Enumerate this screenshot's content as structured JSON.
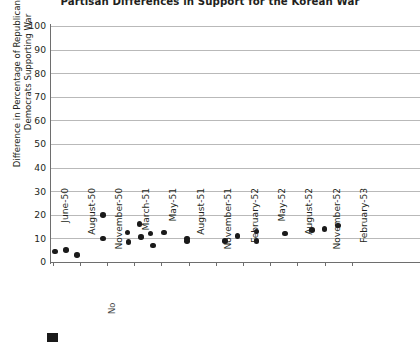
{
  "chart_data": {
    "type": "scatter",
    "title": "Partisan Differences in Support for the Korean War",
    "xlabel": "",
    "ylabel": "Difference in Percentage of Republicans and Democrats Supporting War",
    "ylim": [
      0,
      100
    ],
    "y_ticks": [
      100,
      90,
      80,
      70,
      60,
      50,
      40,
      30,
      20,
      10,
      0
    ],
    "grid": true,
    "legend_position": "bottom-left",
    "categories": [
      "June-50",
      "August-50",
      "November-50",
      "March-51",
      "May-51",
      "August-51",
      "November-51",
      "February-52",
      "May-52",
      "August-52",
      "November-52",
      "February-53"
    ],
    "series": [
      {
        "name": "Difference in percentage of Republicans and Democrats supporting war",
        "marker": "circle",
        "color": "#1a1a1a",
        "points": [
          {
            "x": 0.1,
            "y": 4.5
          },
          {
            "x": 0.5,
            "y": 5.0
          },
          {
            "x": 0.9,
            "y": 3.0
          },
          {
            "x": 1.85,
            "y": 20.0
          },
          {
            "x": 1.85,
            "y": 10.0
          },
          {
            "x": 2.75,
            "y": 12.5
          },
          {
            "x": 2.8,
            "y": 8.5
          },
          {
            "x": 3.2,
            "y": 16.0
          },
          {
            "x": 3.25,
            "y": 10.5
          },
          {
            "x": 3.6,
            "y": 12.0
          },
          {
            "x": 3.7,
            "y": 7.0
          },
          {
            "x": 4.1,
            "y": 12.5
          },
          {
            "x": 4.95,
            "y": 10.0
          },
          {
            "x": 4.95,
            "y": 9.0
          },
          {
            "x": 6.35,
            "y": 9.0
          },
          {
            "x": 6.8,
            "y": 11.0
          },
          {
            "x": 7.5,
            "y": 13.0
          },
          {
            "x": 7.5,
            "y": 9.0
          },
          {
            "x": 8.55,
            "y": 12.0
          },
          {
            "x": 9.55,
            "y": 13.5
          },
          {
            "x": 10.0,
            "y": 14.0
          },
          {
            "x": 10.5,
            "y": 15.5
          }
        ]
      }
    ]
  },
  "legend": {
    "swatch_color": "#1a1a1a",
    "label": "",
    "fragment_text": "No"
  }
}
